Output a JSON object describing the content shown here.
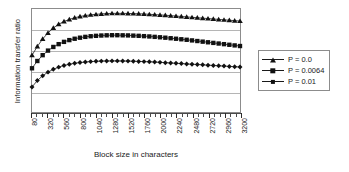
{
  "chart_data": {
    "type": "line",
    "title": "",
    "xlabel": "Block size in characters",
    "ylabel": "Information transfer ratio",
    "xlim": [
      80,
      3200
    ],
    "ylim": [
      0,
      1
    ],
    "grid": true,
    "gridlines_y": [
      0.2,
      0.4,
      0.6,
      0.8
    ],
    "y_tick_labels": [],
    "legend_position": "right",
    "x_tick_labels": [
      "80",
      "320",
      "560",
      "800",
      "1040",
      "1280",
      "1520",
      "1760",
      "2000",
      "2240",
      "2480",
      "2720",
      "2960",
      "3200"
    ],
    "x_tick_step": 240,
    "x_minor_step": 80,
    "x": [
      80,
      160,
      240,
      320,
      400,
      480,
      560,
      640,
      720,
      800,
      880,
      960,
      1040,
      1120,
      1200,
      1280,
      1360,
      1440,
      1520,
      1600,
      1680,
      1760,
      1840,
      1920,
      2000,
      2080,
      2160,
      2240,
      2320,
      2400,
      2480,
      2560,
      2640,
      2720,
      2800,
      2880,
      2960,
      3040,
      3120,
      3200
    ],
    "series": [
      {
        "name": "P = 0.0",
        "marker": "triangle",
        "values": [
          0.555,
          0.64,
          0.712,
          0.77,
          0.818,
          0.853,
          0.88,
          0.9,
          0.916,
          0.928,
          0.937,
          0.944,
          0.949,
          0.953,
          0.956,
          0.958,
          0.958,
          0.958,
          0.957,
          0.956,
          0.954,
          0.952,
          0.949,
          0.946,
          0.943,
          0.94,
          0.936,
          0.932,
          0.928,
          0.924,
          0.92,
          0.916,
          0.912,
          0.908,
          0.904,
          0.9,
          0.896,
          0.892,
          0.888,
          0.884
        ]
      },
      {
        "name": "P = 0.0064",
        "marker": "square",
        "values": [
          0.43,
          0.5,
          0.556,
          0.6,
          0.635,
          0.662,
          0.684,
          0.701,
          0.714,
          0.724,
          0.732,
          0.738,
          0.742,
          0.745,
          0.747,
          0.748,
          0.748,
          0.747,
          0.746,
          0.744,
          0.742,
          0.739,
          0.736,
          0.732,
          0.728,
          0.724,
          0.719,
          0.714,
          0.709,
          0.704,
          0.698,
          0.692,
          0.686,
          0.68,
          0.674,
          0.668,
          0.662,
          0.656,
          0.65,
          0.644
        ]
      },
      {
        "name": "P = 0.01",
        "marker": "diamond",
        "values": [
          0.25,
          0.312,
          0.358,
          0.393,
          0.42,
          0.441,
          0.457,
          0.469,
          0.478,
          0.485,
          0.49,
          0.494,
          0.497,
          0.499,
          0.5,
          0.501,
          0.501,
          0.5,
          0.499,
          0.498,
          0.496,
          0.494,
          0.492,
          0.49,
          0.487,
          0.484,
          0.481,
          0.478,
          0.475,
          0.472,
          0.469,
          0.466,
          0.463,
          0.46,
          0.457,
          0.454,
          0.451,
          0.448,
          0.445,
          0.442
        ]
      }
    ]
  },
  "colors": {
    "ink": "#1a1a1a",
    "frame": "#8c8c8c",
    "grid": "#b5b5b5",
    "marker": "#111111"
  }
}
